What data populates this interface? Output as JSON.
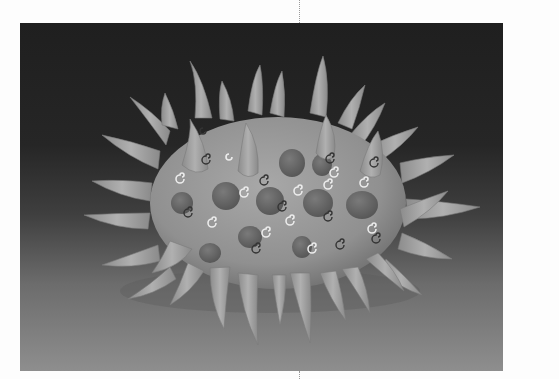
{
  "page": {
    "background": "#fdfdfd"
  },
  "photo": {
    "subject": "spiky ceramic sculpture",
    "description": "Grayscale photograph of an oval ceramic vessel covered with cone-shaped spikes, dark round bumps and small painted spirals, on a dark-to-light gradient backdrop",
    "colors": {
      "backdrop_top": "#1f1f1f",
      "backdrop_bottom": "#8e8e8e",
      "body": "#9a9a9a",
      "spike": "#a3a3a3",
      "bump": "#6a6a6a",
      "spiral_light": "#e8e8e8",
      "spiral_dark": "#3a3a3a"
    }
  }
}
